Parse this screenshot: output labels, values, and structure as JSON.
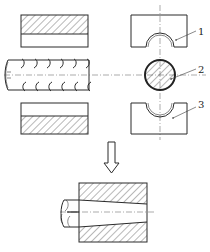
{
  "figure": {
    "type": "technical-drawing",
    "callouts": [
      {
        "id": "1",
        "label": "1",
        "target": "upper die half"
      },
      {
        "id": "2",
        "label": "2",
        "target": "rebar cross-section"
      },
      {
        "id": "3",
        "label": "3",
        "target": "lower die half"
      }
    ],
    "arrow": {
      "direction": "down",
      "meaning": "process result"
    },
    "colors": {
      "line": "#2a2a2a",
      "background": "#ffffff"
    }
  }
}
